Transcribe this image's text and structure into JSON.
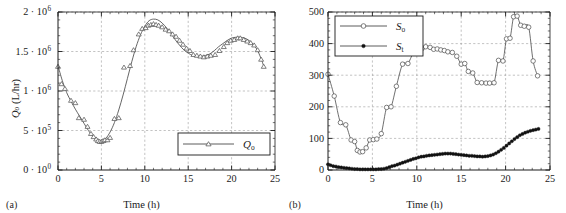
{
  "figure": {
    "panels": [
      {
        "caption": "(a)",
        "xlabel": "Time (h)",
        "ylabel_parts": {
          "sym": "Q",
          "sub": "o",
          "unit": " (L/hr)"
        },
        "ylabel": "Qo (L/hr)"
      },
      {
        "caption": "(b)",
        "xlabel": "Time (h)",
        "ylabel": "Infl./eff. BOD's (mg/L)"
      }
    ]
  },
  "colors": {
    "axis": "#1a1a1a",
    "grid": "#9a9a9a",
    "curve": "#4a4a4a",
    "marker_open": "#ffffff",
    "marker_edge": "#4a4a4a",
    "marker_fill": "#111111",
    "text": "#1a1a1a"
  },
  "chart_data": [
    {
      "type": "scatter",
      "panel": "a",
      "title": "",
      "xlabel": "Time (h)",
      "ylabel": "Qo (L/hr)",
      "xlim": [
        0,
        25
      ],
      "ylim": [
        0,
        2000000
      ],
      "xticks": [
        0,
        5,
        10,
        15,
        20,
        25
      ],
      "xticklabels": [
        "0",
        "5",
        "10",
        "15",
        "20",
        "25"
      ],
      "yticks": [
        0,
        500000,
        1000000,
        1500000,
        2000000
      ],
      "yticklabels": [
        "0 · 10⁰",
        "5 · 10⁵",
        "1 · 10⁶",
        "1.5 · 10⁶",
        "2 · 10⁶"
      ],
      "ytick_mantissa": [
        "0",
        "5",
        "1",
        "1.5",
        "2"
      ],
      "ytick_exponent": [
        "0",
        "5",
        "6",
        "6",
        "6"
      ],
      "grid": true,
      "minor_tick_step_x": 1,
      "legend": [
        {
          "label": "Qo",
          "sym": "Q",
          "sub": "o",
          "marker": "triangle-open"
        }
      ],
      "legend_position": "lower right",
      "series": [
        {
          "name": "Qo",
          "marker": "triangle-open",
          "x": [
            0.0,
            0.4,
            0.8,
            1.5,
            2.0,
            2.4,
            3.0,
            3.4,
            3.8,
            4.1,
            4.4,
            4.6,
            4.8,
            5.0,
            5.2,
            5.4,
            5.7,
            6.0,
            6.5,
            7.0,
            7.6,
            8.3,
            8.7,
            9.3,
            9.7,
            10.1,
            10.4,
            10.7,
            11.0,
            11.3,
            11.6,
            12.0,
            12.4,
            12.8,
            13.2,
            13.6,
            14.0,
            14.4,
            14.8,
            15.2,
            15.6,
            16.0,
            16.4,
            16.8,
            17.2,
            17.6,
            18.1,
            18.6,
            19.1,
            19.5,
            19.9,
            20.3,
            20.7,
            21.0,
            21.4,
            21.8,
            22.2,
            22.6,
            23.0,
            23.4,
            23.7
          ],
          "y": [
            1310000,
            1090000,
            1030000,
            880000,
            850000,
            660000,
            640000,
            550000,
            460000,
            420000,
            390000,
            370000,
            360000,
            360000,
            370000,
            380000,
            380000,
            410000,
            650000,
            660000,
            1300000,
            1320000,
            1520000,
            1720000,
            1790000,
            1800000,
            1830000,
            1840000,
            1850000,
            1840000,
            1830000,
            1810000,
            1780000,
            1760000,
            1720000,
            1690000,
            1640000,
            1590000,
            1540000,
            1510000,
            1460000,
            1450000,
            1440000,
            1430000,
            1440000,
            1450000,
            1460000,
            1510000,
            1560000,
            1610000,
            1640000,
            1650000,
            1670000,
            1670000,
            1650000,
            1630000,
            1610000,
            1580000,
            1520000,
            1400000,
            1310000
          ]
        }
      ],
      "fit_curve": {
        "name": "Qo smooth fit",
        "x": [
          0.0,
          0.5,
          1.0,
          1.5,
          2.0,
          2.5,
          3.0,
          3.5,
          4.0,
          4.5,
          5.0,
          5.5,
          6.0,
          6.5,
          7.0,
          7.5,
          8.0,
          8.5,
          9.0,
          9.5,
          10.0,
          10.5,
          11.0,
          11.5,
          12.0,
          12.5,
          13.0,
          13.5,
          14.0,
          14.5,
          15.0,
          15.5,
          16.0,
          16.5,
          17.0,
          17.5,
          18.0,
          18.5,
          19.0,
          19.5,
          20.0,
          20.5,
          21.0,
          21.5,
          22.0,
          22.5,
          23.0,
          23.5,
          23.7
        ],
        "y": [
          1320000,
          1130000,
          980000,
          870000,
          770000,
          680000,
          590000,
          500000,
          430000,
          380000,
          370000,
          400000,
          480000,
          600000,
          760000,
          950000,
          1160000,
          1370000,
          1560000,
          1710000,
          1820000,
          1890000,
          1910000,
          1900000,
          1860000,
          1800000,
          1730000,
          1650000,
          1580000,
          1520000,
          1480000,
          1450000,
          1440000,
          1440000,
          1450000,
          1470000,
          1510000,
          1560000,
          1600000,
          1640000,
          1670000,
          1680000,
          1680000,
          1670000,
          1640000,
          1590000,
          1510000,
          1380000,
          1310000
        ]
      }
    },
    {
      "type": "scatter",
      "panel": "b",
      "title": "",
      "xlabel": "Time (h)",
      "ylabel": "Infl./eff. BOD's (mg/L)",
      "xlim": [
        0,
        25
      ],
      "ylim": [
        0,
        500
      ],
      "xticks": [
        0,
        5,
        10,
        15,
        20,
        25
      ],
      "xticklabels": [
        "0",
        "5",
        "10",
        "15",
        "20",
        "25"
      ],
      "yticks": [
        0,
        100,
        200,
        300,
        400,
        500
      ],
      "yticklabels": [
        "0",
        "100",
        "200",
        "300",
        "400",
        "500"
      ],
      "grid": true,
      "minor_tick_step_x": 1,
      "legend": [
        {
          "label": "So",
          "sym": "S",
          "sub": "o",
          "marker": "circle-open"
        },
        {
          "label": "St",
          "sym": "S",
          "sub": "t",
          "marker": "circle-filled"
        }
      ],
      "legend_position": "upper left",
      "series": [
        {
          "name": "So",
          "marker": "circle-open",
          "x": [
            0.0,
            0.7,
            1.4,
            2.0,
            2.6,
            3.0,
            3.3,
            3.6,
            3.9,
            4.3,
            4.7,
            5.1,
            5.5,
            6.0,
            6.6,
            7.1,
            7.7,
            8.4,
            9.0,
            9.6,
            10.1,
            10.6,
            11.0,
            11.5,
            11.9,
            12.3,
            12.7,
            13.1,
            13.5,
            14.0,
            14.5,
            15.0,
            15.4,
            15.8,
            16.3,
            16.8,
            17.3,
            17.8,
            18.2,
            18.7,
            19.2,
            19.7,
            20.1,
            20.5,
            20.9,
            21.3,
            21.7,
            22.1,
            22.6,
            23.1,
            23.6
          ],
          "y": [
            303,
            234,
            150,
            143,
            95,
            90,
            62,
            57,
            58,
            70,
            95,
            96,
            98,
            115,
            198,
            200,
            265,
            335,
            337,
            370,
            375,
            385,
            390,
            388,
            382,
            383,
            380,
            378,
            374,
            372,
            360,
            335,
            337,
            312,
            307,
            277,
            276,
            275,
            275,
            276,
            347,
            345,
            415,
            417,
            485,
            487,
            458,
            455,
            452,
            345,
            298
          ]
        },
        {
          "name": "St",
          "marker": "circle-filled",
          "x": [
            0.0,
            0.3,
            0.6,
            0.9,
            1.2,
            1.5,
            1.8,
            2.1,
            2.4,
            2.7,
            3.0,
            3.3,
            3.6,
            3.9,
            4.2,
            4.5,
            4.8,
            5.1,
            5.4,
            5.7,
            6.0,
            6.3,
            6.6,
            6.9,
            7.2,
            7.5,
            7.8,
            8.1,
            8.4,
            8.7,
            9.0,
            9.3,
            9.6,
            9.9,
            10.2,
            10.5,
            10.8,
            11.1,
            11.4,
            11.7,
            12.0,
            12.3,
            12.6,
            12.9,
            13.2,
            13.5,
            13.8,
            14.1,
            14.4,
            14.7,
            15.0,
            15.3,
            15.6,
            15.9,
            16.2,
            16.5,
            16.8,
            17.1,
            17.4,
            17.7,
            18.0,
            18.3,
            18.6,
            18.9,
            19.2,
            19.5,
            19.8,
            20.1,
            20.4,
            20.7,
            21.0,
            21.3,
            21.6,
            21.9,
            22.2,
            22.5,
            22.8,
            23.1,
            23.4,
            23.7
          ],
          "y": [
            18,
            15,
            12,
            11,
            9,
            8,
            7,
            6,
            5,
            4,
            3,
            3,
            2,
            2,
            2,
            2,
            2,
            2,
            2,
            3,
            3,
            4,
            6,
            9,
            12,
            14,
            17,
            20,
            23,
            26,
            29,
            32,
            35,
            37,
            40,
            42,
            43,
            45,
            46,
            47,
            48,
            49,
            50,
            51,
            52,
            52,
            52,
            51,
            50,
            49,
            48,
            47,
            46,
            45,
            45,
            44,
            43,
            43,
            42,
            43,
            44,
            46,
            49,
            53,
            58,
            64,
            70,
            77,
            84,
            91,
            98,
            104,
            110,
            114,
            118,
            121,
            124,
            126,
            128,
            130
          ]
        }
      ]
    }
  ]
}
